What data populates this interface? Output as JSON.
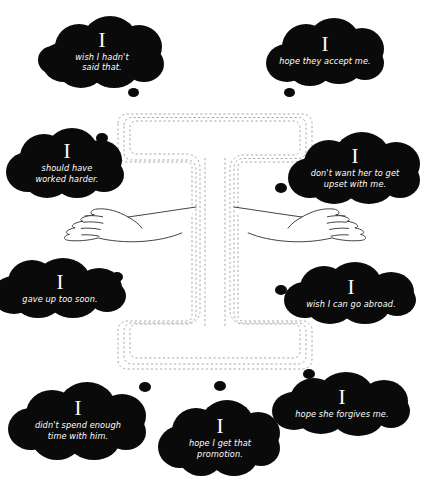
{
  "page": {
    "background_color": "#ffffff",
    "cloud_color": "#0a0a0a",
    "text_color": "#ffffff",
    "maze_line_color": "#9a9a9a",
    "arm_line_color": "#1a1a1a",
    "pronoun": "I"
  },
  "clouds": [
    {
      "id": "wish-i-hadnt-said-that",
      "pronoun": "I",
      "message": "wish I hadn't\nsaid that."
    },
    {
      "id": "hope-they-accept-me",
      "pronoun": "I",
      "message": "hope they accept me."
    },
    {
      "id": "should-have-worked-harder",
      "pronoun": "I",
      "message": "should have\nworked harder."
    },
    {
      "id": "dont-want-her-to-get-upset-with-me",
      "pronoun": "I",
      "message": "don't want her to get\nupset with me."
    },
    {
      "id": "gave-up-too-soon",
      "pronoun": "I",
      "message": "gave up too soon."
    },
    {
      "id": "wish-i-can-go-abroad",
      "pronoun": "I",
      "message": "wish I can go abroad."
    },
    {
      "id": "didnt-spend-enough-time-with-him",
      "pronoun": "I",
      "message": "didn't spend enough\ntime with him."
    },
    {
      "id": "hope-i-get-that-promotion",
      "pronoun": "I",
      "message": "hope I get that\npromotion."
    },
    {
      "id": "hope-she-forgives-me",
      "pronoun": "I",
      "message": "hope she forgives me."
    }
  ]
}
